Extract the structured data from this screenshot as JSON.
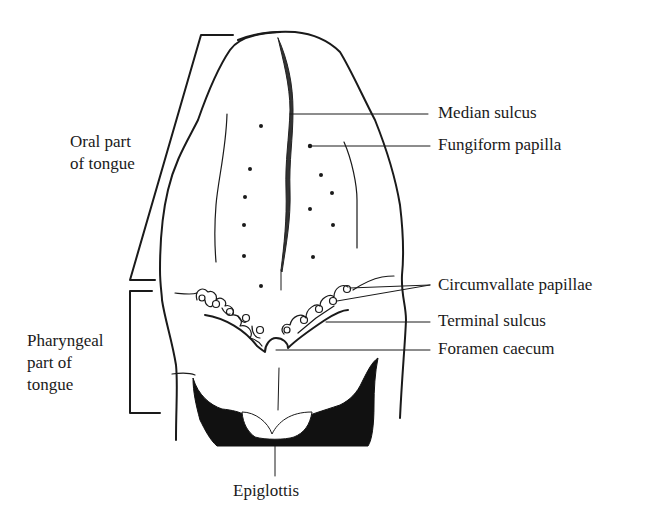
{
  "figure": {
    "colors": {
      "ink": "#1a1a1a",
      "background": "#ffffff"
    }
  },
  "labels": {
    "oral_part": {
      "line1": "Oral part",
      "line2": "of tongue"
    },
    "pharyngeal_part": {
      "line1": "Pharyngeal",
      "line2": "part of",
      "line3": "tongue"
    },
    "median_sulcus": "Median sulcus",
    "fungiform_papilla": "Fungiform papilla",
    "circumvallate_papillae": "Circumvallate papillae",
    "terminal_sulcus": "Terminal sulcus",
    "foramen_caecum": "Foramen caecum",
    "epiglottis": "Epiglottis"
  }
}
